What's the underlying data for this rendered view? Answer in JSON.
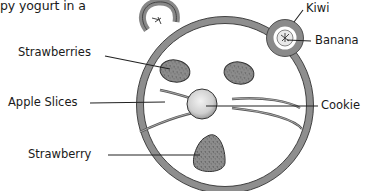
{
  "document": {
    "text_snippet": "py yogurt in a",
    "illustration": {
      "subject": "mouse-face snack on a plate",
      "labels": {
        "kiwi": "Kiwi",
        "banana": "Banana",
        "strawberries": "Strawberries",
        "apple_slices": "Apple Slices",
        "cookie": "Cookie",
        "strawberry": "Strawberry"
      }
    }
  }
}
